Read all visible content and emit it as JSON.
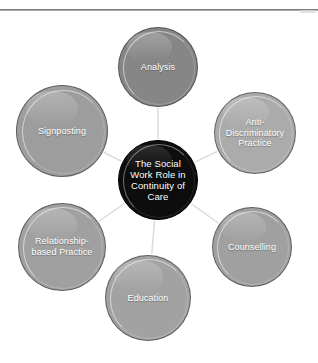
{
  "page": {
    "background": "#ffffff",
    "rule_color": "#7d7d7d"
  },
  "diagram": {
    "type": "hub-and-spoke",
    "connector_color": "#d9d9d9",
    "center": {
      "id": "center",
      "label": "The Social Work Role in Continuity of Care",
      "lines": [
        "The Social",
        "Work Role in",
        "Continuity of",
        "Care"
      ],
      "fill": "#0d0d0d",
      "text_color": "#ffffff",
      "cx": 158,
      "cy": 168,
      "r": 40,
      "font_size": 9.5
    },
    "nodes": [
      {
        "id": "analysis",
        "label": "Analysis",
        "lines": [
          "Analysis"
        ],
        "fill": "#868686",
        "text_color": "#ffffff",
        "cx": 158,
        "cy": 55,
        "r": 40,
        "font_size": 9
      },
      {
        "id": "anti-discriminatory-practice",
        "label": "Anti-Discriminatory Practice",
        "lines": [
          "Anti-",
          "Discriminatory",
          "Practice"
        ],
        "fill": "#ababab",
        "text_color": "#ffffff",
        "cx": 255,
        "cy": 121,
        "r": 41,
        "font_size": 9
      },
      {
        "id": "counselling",
        "label": "Counselling",
        "lines": [
          "Counselling"
        ],
        "fill": "#a0a0a0",
        "text_color": "#ffffff",
        "cx": 252,
        "cy": 235,
        "r": 40,
        "font_size": 9
      },
      {
        "id": "education",
        "label": "Education",
        "lines": [
          "Education"
        ],
        "fill": "#a2a2a2",
        "text_color": "#ffffff",
        "cx": 148,
        "cy": 286,
        "r": 43,
        "font_size": 9
      },
      {
        "id": "relationship-based-practice",
        "label": "Relationship-based Practice",
        "lines": [
          "Relationship-",
          "based Practice"
        ],
        "fill": "#a0a0a0",
        "text_color": "#ffffff",
        "cx": 62,
        "cy": 235,
        "r": 44,
        "font_size": 9
      },
      {
        "id": "signposting",
        "label": "Signposting",
        "lines": [
          "Signposting"
        ],
        "fill": "#9d9d9d",
        "text_color": "#ffffff",
        "cx": 62,
        "cy": 119,
        "r": 46,
        "font_size": 9
      }
    ]
  }
}
